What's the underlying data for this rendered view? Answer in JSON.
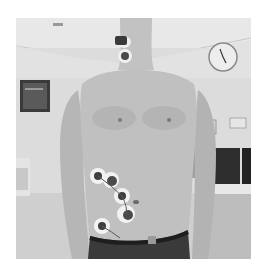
{
  "image": {
    "description": "Grayscale photo of a shirtless man standing in a room, with electrode/sensor patches attached to his neck and left abdomen",
    "palette": {
      "background": "#ffffff",
      "ceiling": "#e6e6e6",
      "wall": "#dadada",
      "floor": "#cfcfcf",
      "skin": "#bdbdbd",
      "skin_shadow": "#a4a4a4",
      "dark": "#2e2e2e",
      "sensor_pad": "#f2f2f2",
      "sensor_core": "#4a4a4a"
    },
    "objects": [
      "ceiling",
      "wall-clock",
      "wall-monitor",
      "torso",
      "neck-sensor",
      "abdomen-sensors",
      "belt",
      "desk-computer"
    ]
  }
}
